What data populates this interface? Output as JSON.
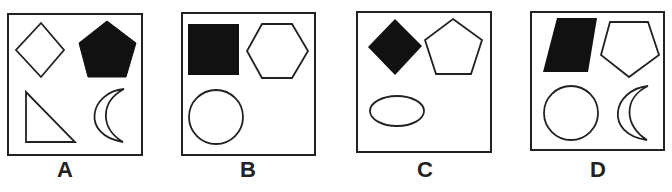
{
  "figure": {
    "stroke_color": "#222222",
    "fill_color": "#111111",
    "background": "#ffffff",
    "options": [
      {
        "label": "A",
        "shapes": [
          {
            "type": "diamond",
            "filled": false,
            "position": "top-left"
          },
          {
            "type": "pentagon",
            "filled": true,
            "position": "top-right"
          },
          {
            "type": "right-triangle",
            "filled": false,
            "position": "bottom-left"
          },
          {
            "type": "crescent",
            "filled": false,
            "position": "bottom-right"
          }
        ]
      },
      {
        "label": "B",
        "shapes": [
          {
            "type": "square",
            "filled": true,
            "position": "top-left"
          },
          {
            "type": "hexagon",
            "filled": false,
            "position": "top-right"
          },
          {
            "type": "circle",
            "filled": false,
            "position": "bottom-left"
          }
        ]
      },
      {
        "label": "C",
        "shapes": [
          {
            "type": "diamond",
            "filled": true,
            "position": "top-left"
          },
          {
            "type": "pentagon",
            "filled": false,
            "position": "top-right"
          },
          {
            "type": "ellipse",
            "filled": false,
            "position": "bottom-left"
          }
        ]
      },
      {
        "label": "D",
        "shapes": [
          {
            "type": "parallelogram",
            "filled": true,
            "position": "top-left"
          },
          {
            "type": "pentagon-inverted",
            "filled": false,
            "position": "top-right"
          },
          {
            "type": "circle",
            "filled": false,
            "position": "bottom-left"
          },
          {
            "type": "crescent",
            "filled": false,
            "position": "bottom-right"
          }
        ]
      }
    ]
  }
}
